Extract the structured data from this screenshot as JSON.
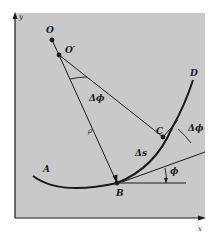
{
  "colors": {
    "panel": "#c9c9c9",
    "ink": "#1a1a1a",
    "background": "#ffffff"
  },
  "axes": {
    "x_label": "x",
    "y_label": "y"
  },
  "points": {
    "O": "O",
    "O_prime": "O′",
    "A": "A",
    "B": "B",
    "C": "C",
    "D": "D"
  },
  "annotations": {
    "delta_phi_center": "Δϕ",
    "delta_phi_tangent": "Δϕ",
    "phi": "ϕ",
    "rho": "ρ",
    "delta_s": "Δs"
  }
}
